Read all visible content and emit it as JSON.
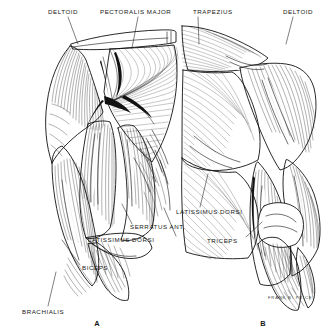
{
  "plate": {
    "title": "Muscles of the Arm and Shoulder",
    "background_color": "#ffffff",
    "ink_color": "#171717",
    "signature": "FRANK B. PRICE,"
  },
  "figures": [
    {
      "letter": "A",
      "view": "anterior",
      "letter_x": 97,
      "letter_y": 324
    },
    {
      "letter": "B",
      "view": "posterior",
      "letter_x": 263,
      "letter_y": 324
    }
  ],
  "labels": [
    {
      "id": "deltoid-left",
      "text": "DELTOID",
      "x": 48,
      "y": 12,
      "anchor": "start"
    },
    {
      "id": "pectoralis-major",
      "text": "PECTORALIS MAJOR",
      "x": 100,
      "y": 12,
      "anchor": "start"
    },
    {
      "id": "trapezius",
      "text": "TRAPEZIUS",
      "x": 193,
      "y": 12,
      "anchor": "start"
    },
    {
      "id": "deltoid-right",
      "text": "DELTOID",
      "x": 283,
      "y": 12,
      "anchor": "start"
    },
    {
      "id": "latissimus-dorsi-right",
      "text": "LATISSIMUS DORSI",
      "x": 176,
      "y": 212,
      "anchor": "start"
    },
    {
      "id": "serratus-anterior",
      "text": "SERRATUS ANT.",
      "x": 130,
      "y": 227,
      "anchor": "start"
    },
    {
      "id": "latissimus-dorsi-left",
      "text": "LATISSIMUS DORSI",
      "x": 88,
      "y": 240,
      "anchor": "start"
    },
    {
      "id": "triceps",
      "text": "TRICEPS",
      "x": 207,
      "y": 241,
      "anchor": "start"
    },
    {
      "id": "biceps",
      "text": "BICEPS",
      "x": 82,
      "y": 268,
      "anchor": "start"
    },
    {
      "id": "brachialis",
      "text": "BRACHIALIS",
      "x": 22,
      "y": 312,
      "anchor": "start"
    }
  ],
  "signature_pos": {
    "x": 268,
    "y": 299
  }
}
